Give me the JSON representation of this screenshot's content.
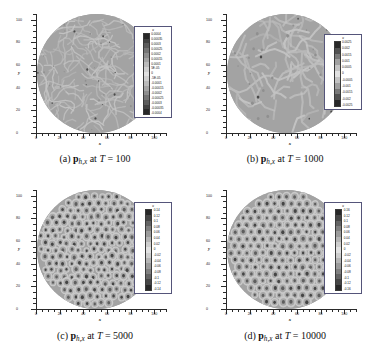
{
  "figure": {
    "kind": "contour-plot-grid",
    "rows": 2,
    "columns": 2,
    "background": "#ffffff"
  },
  "chart_data": [
    {
      "type": "heatmap",
      "panel": "a",
      "title": "p_{h,x} at T = 100",
      "caption_prefix": "(a)",
      "caption_symbol": "p",
      "caption_subscript": "h,x",
      "caption_middle": "at",
      "caption_var": "T",
      "caption_value": "100",
      "domain_shape": "circle",
      "xlabel": "x",
      "ylabel": "y",
      "xlim": [
        0,
        110
      ],
      "ylim": [
        0,
        105
      ],
      "xticks": [
        0,
        20,
        40,
        60,
        80,
        100
      ],
      "yticks": [
        0,
        20,
        40,
        60,
        80,
        100
      ],
      "grid": false,
      "legend_position": "right",
      "legend_title": "u",
      "colorbar_levels": [
        "0.0004",
        "0.00035",
        "0.0003",
        "0.00025",
        "0.0002",
        "0.00015",
        "0.0001",
        "5E-05",
        "0",
        "-5E-05",
        "-0.0001",
        "-0.00015",
        "-0.0002",
        "-0.00025",
        "-0.0003",
        "-0.00035",
        "-0.0004"
      ],
      "vmin": -0.0004,
      "vmax": 0.0004,
      "pattern": "fine-irregular-labyrinth",
      "feature_scale": 4.0,
      "seed": 11
    },
    {
      "type": "heatmap",
      "panel": "b",
      "title": "p_{h,x} at T = 1000",
      "caption_prefix": "(b)",
      "caption_symbol": "p",
      "caption_subscript": "h,x",
      "caption_middle": "at",
      "caption_var": "T",
      "caption_value": "1000",
      "domain_shape": "circle",
      "xlabel": "x",
      "ylabel": "y",
      "xlim": [
        0,
        110
      ],
      "ylim": [
        0,
        105
      ],
      "xticks": [
        0,
        20,
        40,
        60,
        80,
        100
      ],
      "yticks": [
        0,
        20,
        40,
        60,
        80,
        100
      ],
      "grid": false,
      "legend_position": "right",
      "legend_title": "u",
      "colorbar_levels": [
        "0.0025",
        "0.002",
        "0.0015",
        "0.001",
        "0.0005",
        "0",
        "-0.0005",
        "-0.001",
        "-0.0015",
        "-0.002",
        "-0.0025"
      ],
      "vmin": -0.0025,
      "vmax": 0.0025,
      "pattern": "coarse-labyrinth",
      "feature_scale": 6.0,
      "seed": 27
    },
    {
      "type": "heatmap",
      "panel": "c",
      "title": "p_{h,x} at T = 5000",
      "caption_prefix": "(c)",
      "caption_symbol": "p",
      "caption_subscript": "h,x",
      "caption_middle": "at",
      "caption_var": "T",
      "caption_value": "5000",
      "domain_shape": "circle",
      "xlabel": "x",
      "ylabel": "y",
      "xlim": [
        0,
        110
      ],
      "ylim": [
        0,
        105
      ],
      "xticks": [
        0,
        20,
        40,
        60,
        80,
        100
      ],
      "yticks": [
        0,
        20,
        40,
        60,
        80,
        100
      ],
      "grid": false,
      "legend_position": "right",
      "legend_title": "u",
      "colorbar_levels": [
        "0.14",
        "0.12",
        "0.1",
        "0.08",
        "0.06",
        "0.04",
        "0.02",
        "0",
        "-0.02",
        "-0.04",
        "-0.06",
        "-0.08",
        "-0.1",
        "-0.12",
        "-0.14"
      ],
      "vmin": -0.14,
      "vmax": 0.14,
      "pattern": "hexagonal-spot-lattice-defective",
      "feature_scale": 7.6,
      "seed": 43
    },
    {
      "type": "heatmap",
      "panel": "d",
      "title": "p_{h,x} at T = 10000",
      "caption_prefix": "(d)",
      "caption_symbol": "p",
      "caption_subscript": "h,x",
      "caption_middle": "at",
      "caption_var": "T",
      "caption_value": "10000",
      "domain_shape": "circle",
      "xlabel": "x",
      "ylabel": "y",
      "xlim": [
        0,
        110
      ],
      "ylim": [
        0,
        105
      ],
      "xticks": [
        0,
        20,
        40,
        60,
        80,
        100
      ],
      "yticks": [
        0,
        20,
        40,
        60,
        80,
        100
      ],
      "grid": false,
      "legend_position": "right",
      "legend_title": "u",
      "colorbar_levels": [
        "0.16",
        "0.12",
        "0.1",
        "0.08",
        "0.06",
        "0.04",
        "0.02",
        "0",
        "-0.02",
        "-0.04",
        "-0.06",
        "-0.08",
        "-0.1",
        "-0.12",
        "-0.16"
      ],
      "vmin": -0.16,
      "vmax": 0.16,
      "pattern": "hexagonal-spot-lattice-ordered",
      "feature_scale": 8.0,
      "seed": 59
    }
  ]
}
